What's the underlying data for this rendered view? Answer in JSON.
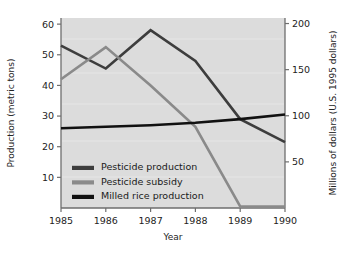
{
  "chart_data": {
    "type": "line",
    "title": "",
    "xlabel": "Year",
    "ylabel": "Production (metric tons)",
    "y2label": "Millions of dollars (U.S. 1995 dollars)",
    "x": [
      1985,
      1986,
      1987,
      1988,
      1989,
      1990
    ],
    "categories": [
      "1985",
      "1986",
      "1987",
      "1988",
      "1989",
      "1990"
    ],
    "xlim": [
      1985,
      1990
    ],
    "ylim": [
      0,
      62
    ],
    "y2lim": [
      0,
      206
    ],
    "yticks": [
      10,
      20,
      30,
      40,
      50,
      60
    ],
    "ytick_labels": [
      "10",
      "20",
      "30",
      "40",
      "50",
      "60"
    ],
    "y2ticks": [
      50,
      100,
      150,
      200
    ],
    "y2tick_labels": [
      "50",
      "100",
      "150",
      "200"
    ],
    "xticks": [
      1985,
      1986,
      1987,
      1988,
      1989,
      1990
    ],
    "xtick_labels": [
      "1985",
      "1986",
      "1987",
      "1988",
      "1989",
      "1990"
    ],
    "grid": false,
    "legend_position": "lower-left-inside",
    "plot_background": "#dcdcdc",
    "series": [
      {
        "name": "Pesticide production",
        "axis": "left",
        "color": "#3d3d3d",
        "values": [
          53,
          45.5,
          58,
          48,
          29,
          21.5
        ]
      },
      {
        "name": "Pesticide subsidy",
        "axis": "left",
        "color": "#8a8a8a",
        "values": [
          42,
          52.5,
          40,
          26.5,
          0.5,
          0.5
        ]
      },
      {
        "name": "Milled rice production",
        "axis": "left",
        "color": "#111111",
        "values": [
          26,
          26.5,
          27,
          27.8,
          29,
          30.5
        ]
      }
    ]
  },
  "legend": {
    "items": [
      {
        "label": "Pesticide production",
        "color": "#3d3d3d"
      },
      {
        "label": "Pesticide subsidy",
        "color": "#8a8a8a"
      },
      {
        "label": "Milled rice production",
        "color": "#111111"
      }
    ]
  },
  "axes": {
    "left_title": "Production (metric tons)",
    "right_title": "Millions of dollars (U.S. 1995 dollars)",
    "bottom_title": "Year"
  }
}
